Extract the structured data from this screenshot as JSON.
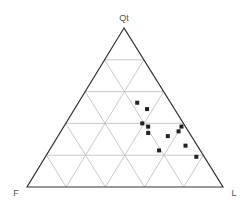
{
  "chart_data": {
    "type": "scatter",
    "subtype": "ternary",
    "title": "",
    "vertices": {
      "top": "Qt",
      "left": "F",
      "right": "L"
    },
    "grid": true,
    "grid_step": 0.2,
    "marker": "square",
    "points": [
      {
        "Qt": 0.53,
        "F": 0.17,
        "L": 0.3
      },
      {
        "Qt": 0.49,
        "F": 0.14,
        "L": 0.37
      },
      {
        "Qt": 0.4,
        "F": 0.21,
        "L": 0.39
      },
      {
        "Qt": 0.38,
        "F": 0.19,
        "L": 0.43
      },
      {
        "Qt": 0.38,
        "F": 0.02,
        "L": 0.6
      },
      {
        "Qt": 0.34,
        "F": 0.21,
        "L": 0.45
      },
      {
        "Qt": 0.35,
        "F": 0.05,
        "L": 0.6
      },
      {
        "Qt": 0.32,
        "F": 0.12,
        "L": 0.56
      },
      {
        "Qt": 0.26,
        "F": 0.06,
        "L": 0.68
      },
      {
        "Qt": 0.23,
        "F": 0.21,
        "L": 0.56
      },
      {
        "Qt": 0.19,
        "F": 0.04,
        "L": 0.77
      }
    ],
    "colors": {
      "frame": "#333333",
      "grid": "#bbbbbb",
      "marker": "#222222"
    }
  }
}
